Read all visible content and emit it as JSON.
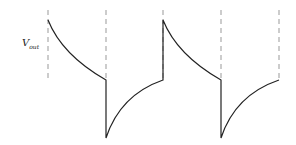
{
  "diagram": {
    "ylabel_main": "V",
    "ylabel_sub": "out",
    "colors": {
      "waveform": "#222222",
      "guides": "#999999",
      "background": "#ffffff"
    },
    "guide_x": [
      48,
      106,
      163,
      221,
      279
    ],
    "levels": {
      "top": 20,
      "mid": 80,
      "bottom": 138,
      "guide_top": 10
    },
    "segments": [
      {
        "type": "decay",
        "from": [
          48,
          20
        ],
        "to": [
          106,
          80
        ]
      },
      {
        "type": "drop",
        "from": [
          106,
          80
        ],
        "to": [
          106,
          138
        ]
      },
      {
        "type": "rise",
        "from": [
          106,
          138
        ],
        "to": [
          163,
          80
        ]
      },
      {
        "type": "jump",
        "from": [
          163,
          80
        ],
        "to": [
          163,
          20
        ]
      },
      {
        "type": "decay",
        "from": [
          163,
          20
        ],
        "to": [
          221,
          80
        ]
      },
      {
        "type": "drop",
        "from": [
          221,
          80
        ],
        "to": [
          221,
          138
        ]
      },
      {
        "type": "rise",
        "from": [
          221,
          138
        ],
        "to": [
          279,
          80
        ]
      }
    ]
  }
}
